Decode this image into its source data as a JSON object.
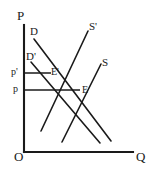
{
  "figure": {
    "type": "supply-demand-diagram",
    "background": "#ffffff",
    "ink": "#1a1a1a",
    "width": 153,
    "height": 172
  },
  "axes": {
    "vertical": {
      "label": "P",
      "label_x": 17,
      "label_y": 9,
      "x": 24,
      "y_top": 25,
      "y_bottom": 152
    },
    "horizontal": {
      "label": "Q",
      "label_x": 136,
      "label_y": 150,
      "y": 152,
      "x_left": 24,
      "x_right": 133
    },
    "origin": {
      "label": "O",
      "label_x": 14,
      "label_y": 150
    }
  },
  "curves": [
    {
      "name": "demand",
      "label": "D",
      "label_x": 30,
      "label_y": 26,
      "x1": 34,
      "y1": 39,
      "x2": 111,
      "y2": 141
    },
    {
      "name": "demand-shifted",
      "label": "D'",
      "label_x": 26,
      "label_y": 51,
      "x1": 31,
      "y1": 62,
      "x2": 100,
      "y2": 143
    },
    {
      "name": "supply-shifted",
      "label": "S'",
      "label_x": 89,
      "label_y": 21,
      "x1": 41,
      "y1": 131,
      "x2": 88,
      "y2": 31
    },
    {
      "name": "supply",
      "label": "S",
      "label_x": 102,
      "label_y": 57,
      "x1": 62,
      "y1": 142,
      "x2": 101,
      "y2": 64
    }
  ],
  "equilibria": [
    {
      "name": "equilibrium-shifted",
      "label": "E'",
      "label_x": 51,
      "label_y": 67,
      "point_x": 49,
      "point_y": 73
    },
    {
      "name": "equilibrium",
      "label": "E",
      "label_x": 82,
      "label_y": 85,
      "point_x": 78,
      "point_y": 90
    }
  ],
  "price_lines": [
    {
      "name": "price-shifted",
      "label": "p'",
      "label_x": 11,
      "label_y": 67,
      "y": 73,
      "x_from": 24,
      "x_to": 51
    },
    {
      "name": "price",
      "label": "p",
      "label_x": 13,
      "label_y": 84,
      "y": 90,
      "x_from": 24,
      "x_to": 80
    }
  ]
}
